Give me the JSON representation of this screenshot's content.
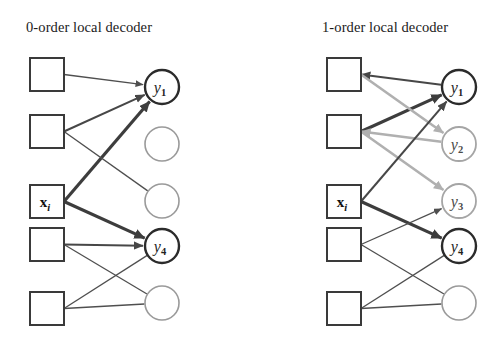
{
  "figure": {
    "width": 504,
    "height": 350,
    "background": "#ffffff"
  },
  "colors": {
    "square_stroke": "#3a3a3a",
    "circle_plain_stroke": "#9a9a9a",
    "circle_active_stroke": "#2b2b2b",
    "edge_thin": "#4f4f4f",
    "edge_bold": "#3d3d3d",
    "edge_gray": "#b0b0b0",
    "text": "#1a1a1a"
  },
  "panels": [
    {
      "id": "zero-order",
      "title": "0-order local decoder",
      "title_x": 26,
      "title_y": 32,
      "squares": [
        {
          "id": "x1",
          "label": "",
          "x": 30,
          "y": 58,
          "w": 34,
          "h": 33
        },
        {
          "id": "x2",
          "label": "",
          "x": 30,
          "y": 115,
          "w": 34,
          "h": 33
        },
        {
          "id": "x3",
          "label": "x",
          "sub": "i",
          "x": 30,
          "y": 185,
          "w": 34,
          "h": 33
        },
        {
          "id": "x4",
          "label": "",
          "x": 30,
          "y": 228,
          "w": 34,
          "h": 33
        },
        {
          "id": "x5",
          "label": "",
          "x": 30,
          "y": 292,
          "w": 34,
          "h": 33
        }
      ],
      "circles": [
        {
          "id": "y1",
          "label": "y",
          "sub": "1",
          "cx": 162,
          "cy": 87,
          "r": 17,
          "style": "active"
        },
        {
          "id": "c2",
          "label": "",
          "sub": "",
          "cx": 162,
          "cy": 144,
          "r": 17,
          "style": "plain"
        },
        {
          "id": "c3",
          "label": "",
          "sub": "",
          "cx": 162,
          "cy": 201,
          "r": 17,
          "style": "plain"
        },
        {
          "id": "y4",
          "label": "y",
          "sub": "4",
          "cx": 162,
          "cy": 246,
          "r": 17,
          "style": "active"
        },
        {
          "id": "c5",
          "label": "",
          "sub": "",
          "cx": 162,
          "cy": 303,
          "r": 17,
          "style": "plain"
        }
      ],
      "edges": [
        {
          "from": "x1",
          "to": "y1",
          "weight": "thin",
          "direction": "forward"
        },
        {
          "from": "x2",
          "to": "y1",
          "weight": "mid",
          "direction": "forward"
        },
        {
          "from": "x3",
          "to": "y1",
          "weight": "bold",
          "direction": "forward"
        },
        {
          "from": "x2",
          "to": "c3",
          "weight": "thin",
          "direction": "none"
        },
        {
          "from": "x3",
          "to": "y4",
          "weight": "bold",
          "direction": "forward"
        },
        {
          "from": "x4",
          "to": "y4",
          "weight": "mid",
          "direction": "forward"
        },
        {
          "from": "x4",
          "to": "c5",
          "weight": "thin",
          "direction": "none"
        },
        {
          "from": "x5",
          "to": "y4",
          "weight": "thin",
          "direction": "none"
        },
        {
          "from": "x5",
          "to": "c5",
          "weight": "thin",
          "direction": "none"
        }
      ]
    },
    {
      "id": "one-order",
      "title": "1-order local decoder",
      "title_x": 322,
      "title_y": 32,
      "squares": [
        {
          "id": "x1",
          "label": "",
          "x": 327,
          "y": 58,
          "w": 34,
          "h": 33
        },
        {
          "id": "x2",
          "label": "",
          "x": 327,
          "y": 115,
          "w": 34,
          "h": 33
        },
        {
          "id": "x3",
          "label": "x",
          "sub": "i",
          "x": 327,
          "y": 185,
          "w": 34,
          "h": 33
        },
        {
          "id": "x4",
          "label": "",
          "x": 327,
          "y": 228,
          "w": 34,
          "h": 33
        },
        {
          "id": "x5",
          "label": "",
          "x": 327,
          "y": 292,
          "w": 34,
          "h": 33
        }
      ],
      "circles": [
        {
          "id": "y1",
          "label": "y",
          "sub": "1",
          "cx": 459,
          "cy": 87,
          "r": 17,
          "style": "active"
        },
        {
          "id": "y2",
          "label": "y",
          "sub": "2",
          "cx": 459,
          "cy": 144,
          "r": 17,
          "style": "dim"
        },
        {
          "id": "y3",
          "label": "y",
          "sub": "3",
          "cx": 459,
          "cy": 201,
          "r": 17,
          "style": "dim"
        },
        {
          "id": "y4",
          "label": "y",
          "sub": "4",
          "cx": 459,
          "cy": 246,
          "r": 17,
          "style": "active"
        },
        {
          "id": "c5",
          "label": "",
          "sub": "",
          "cx": 459,
          "cy": 303,
          "r": 17,
          "style": "plain"
        }
      ],
      "edges": [
        {
          "from": "y1",
          "to": "x1",
          "weight": "mid",
          "direction": "backward"
        },
        {
          "from": "x2",
          "to": "y1",
          "weight": "bold",
          "direction": "forward"
        },
        {
          "from": "x1",
          "to": "y2",
          "weight": "gray",
          "direction": "forward"
        },
        {
          "from": "y2",
          "to": "x2",
          "weight": "gray",
          "direction": "backward"
        },
        {
          "from": "x2",
          "to": "y3",
          "weight": "gray",
          "direction": "forward"
        },
        {
          "from": "x3",
          "to": "y4",
          "weight": "bold",
          "direction": "forward"
        },
        {
          "from": "x4",
          "to": "y3",
          "weight": "thin",
          "direction": "forward"
        },
        {
          "from": "x3",
          "to": "y1",
          "weight": "mid",
          "direction": "forward"
        },
        {
          "from": "x4",
          "to": "c5",
          "weight": "thin",
          "direction": "none"
        },
        {
          "from": "x5",
          "to": "y4",
          "weight": "thin",
          "direction": "none"
        },
        {
          "from": "x5",
          "to": "c5",
          "weight": "thin",
          "direction": "none"
        }
      ]
    }
  ]
}
